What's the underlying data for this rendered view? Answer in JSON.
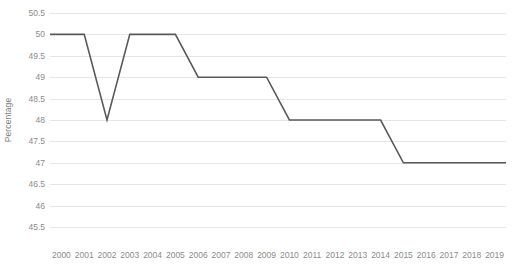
{
  "chart_data": {
    "type": "line",
    "title": "",
    "xlabel": "",
    "ylabel": "Percentage",
    "categories": [
      "2000",
      "2001",
      "2002",
      "2003",
      "2004",
      "2005",
      "2006",
      "2007",
      "2008",
      "2009",
      "2010",
      "2011",
      "2012",
      "2013",
      "2014",
      "2015",
      "2016",
      "2017",
      "2018",
      "2019"
    ],
    "values": [
      50,
      50,
      48,
      50,
      50,
      50,
      49,
      49,
      49,
      49,
      48,
      48,
      48,
      48,
      48,
      47,
      47,
      47,
      47,
      47
    ],
    "series": [
      {
        "name": "Percentage",
        "values": [
          50,
          50,
          48,
          50,
          50,
          50,
          49,
          49,
          49,
          49,
          48,
          48,
          48,
          48,
          48,
          47,
          47,
          47,
          47,
          47
        ]
      }
    ],
    "ylim": [
      45.5,
      50.5
    ],
    "ytick_values": [
      45.5,
      46,
      46.5,
      47,
      47.5,
      48,
      48.5,
      49,
      49.5,
      50,
      50.5
    ],
    "ytick_labels": [
      "45.5",
      "46",
      "46.5",
      "47",
      "47.5",
      "48",
      "48.5",
      "49",
      "49.5",
      "50",
      "50.5"
    ],
    "grid": true,
    "grid_axis": "y",
    "legend": false,
    "legend_position": "none",
    "line_color": "#595959",
    "gridline_color": "#e6e6e6",
    "background_color": "#ffffff",
    "tick_label_color": "#8c8c8c",
    "axis_title_color": "#808080"
  }
}
